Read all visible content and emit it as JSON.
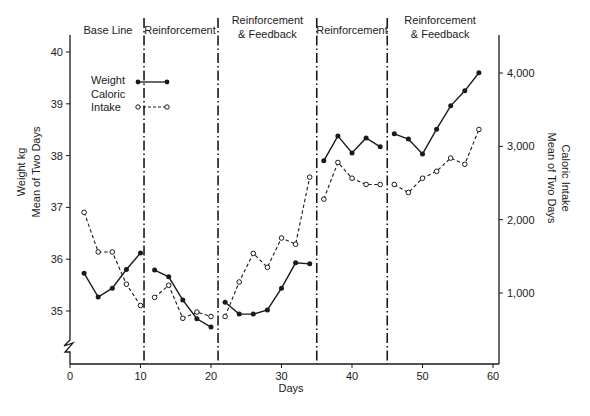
{
  "chart_data": {
    "type": "line",
    "title": "",
    "xlabel": "Days",
    "ylabel": "Weight kg Mean of Two Days",
    "ylabel_right": "Caloric Intake Mean of Two Days",
    "xlim": [
      0,
      60
    ],
    "ylim": [
      34.0,
      40.4
    ],
    "ylim_right": [
      0,
      4500
    ],
    "x_ticks": [
      0,
      10,
      20,
      30,
      40,
      50,
      60
    ],
    "y_ticks": [
      35,
      36,
      37,
      38,
      39,
      40
    ],
    "y_ticks_right": [
      1000,
      2000,
      3000,
      4000
    ],
    "y_tick_labels_right": [
      "1,000",
      "2,000",
      "3,000",
      "4,000"
    ],
    "axis_break": "left y-axis broken below 35",
    "grid": false,
    "legend": {
      "position": "upper-left",
      "entries": [
        {
          "label": "Weight",
          "style": "solid line, filled circle markers"
        },
        {
          "label": "Caloric Intake",
          "style": "dashed line, open circle markers"
        }
      ]
    },
    "phases": [
      {
        "label_lines": [
          "Base Line"
        ],
        "start": 0,
        "end": 10.5
      },
      {
        "label_lines": [
          "Reinforcement"
        ],
        "start": 10.5,
        "end": 21
      },
      {
        "label_lines": [
          "Reinforcement",
          "& Feedback"
        ],
        "start": 21,
        "end": 35
      },
      {
        "label_lines": [
          "Reinforcement"
        ],
        "start": 35,
        "end": 45
      },
      {
        "label_lines": [
          "Reinforcement",
          "& Feedback"
        ],
        "start": 45,
        "end": 60
      }
    ],
    "phase_boundaries": [
      10.5,
      21,
      35,
      45
    ],
    "series": [
      {
        "name": "Weight",
        "axis": "left",
        "segments": [
          {
            "x": [
              2,
              4,
              6,
              8,
              10
            ],
            "y": [
              35.73,
              35.27,
              35.44,
              35.8,
              36.12
            ]
          },
          {
            "x": [
              12,
              14,
              16,
              18,
              20
            ],
            "y": [
              35.79,
              35.66,
              35.21,
              34.85,
              34.69
            ]
          },
          {
            "x": [
              22,
              24,
              26,
              28,
              30,
              32,
              34
            ],
            "y": [
              35.17,
              34.94,
              34.94,
              35.02,
              35.44,
              35.93,
              35.91
            ]
          },
          {
            "x": [
              36,
              38,
              40,
              42,
              44
            ],
            "y": [
              37.9,
              38.38,
              38.05,
              38.34,
              38.17
            ]
          },
          {
            "x": [
              46,
              48,
              50,
              52,
              54,
              56,
              58
            ],
            "y": [
              38.42,
              38.32,
              38.03,
              38.51,
              38.96,
              39.25,
              39.6
            ]
          }
        ]
      },
      {
        "name": "Caloric Intake",
        "axis": "right",
        "segments": [
          {
            "x": [
              2,
              4,
              6,
              8,
              10
            ],
            "y": [
              2100,
              1560,
              1560,
              1120,
              830
            ]
          },
          {
            "x": [
              12,
              14,
              16,
              18,
              20
            ],
            "y": [
              940,
              1105,
              655,
              740,
              680
            ]
          },
          {
            "x": [
              22,
              24,
              26,
              28,
              30,
              32,
              34
            ],
            "y": [
              680,
              1150,
              1540,
              1350,
              1750,
              1665,
              2580
            ]
          },
          {
            "x": [
              36,
              38,
              40,
              42,
              44
            ],
            "y": [
              2280,
              2780,
              2565,
              2480,
              2480
            ]
          },
          {
            "x": [
              46,
              48,
              50,
              52,
              54,
              56,
              58
            ],
            "y": [
              2480,
              2370,
              2565,
              2660,
              2840,
              2755,
              3230
            ]
          }
        ]
      }
    ]
  },
  "labels": {
    "x_axis_title": "Days",
    "y_axis_title_line1": "Weight kg",
    "y_axis_title_line2": "Mean of Two Days",
    "y2_axis_title_line1": "Caloric",
    "y2_axis_title_line1b": "Caloric Intake",
    "y2_axis_title_line2": "Mean of Two Days",
    "legend_weight": "Weight",
    "legend_caloric_1": "Caloric",
    "legend_caloric_2": "Intake"
  },
  "style": {
    "ink": "#1a1a1a",
    "background": "#ffffff"
  }
}
